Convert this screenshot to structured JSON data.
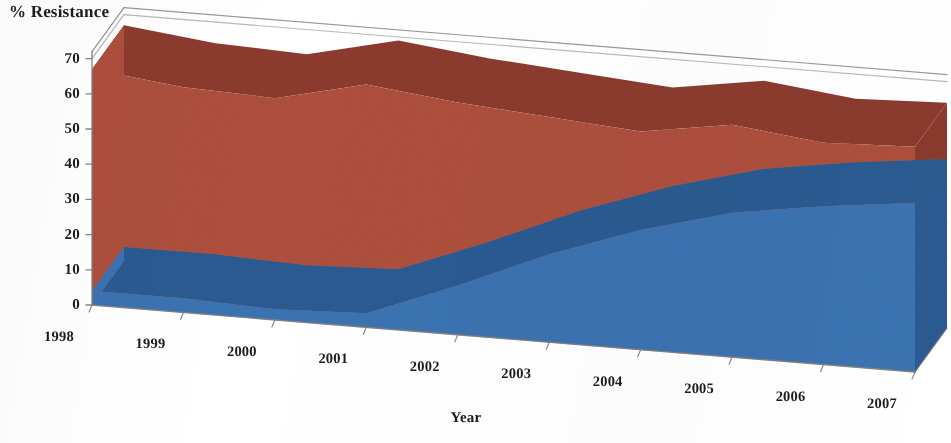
{
  "chart_data": {
    "type": "area",
    "title": "% Resistance",
    "subtitle": "",
    "xlabel": "Year",
    "ylabel": "% Resistance",
    "categories": [
      "1998",
      "1999",
      "2000",
      "2001",
      "2002",
      "2003",
      "2004",
      "2005",
      "2006",
      "2007"
    ],
    "x": [
      1998,
      1999,
      2000,
      2001,
      2002,
      2003,
      2004,
      2005,
      2006,
      2007
    ],
    "series": [
      {
        "name": "series-red-upper",
        "color": "#b0503f",
        "values": [
          67,
          64,
          63,
          69,
          66,
          64,
          62,
          66,
          63,
          64
        ]
      },
      {
        "name": "series-blue-lower",
        "color": "#3b74b4",
        "values": [
          4,
          4,
          3,
          4,
          14,
          25,
          34,
          41,
          45,
          48
        ]
      }
    ],
    "ylim": [
      0,
      70
    ],
    "yticks": [
      0,
      10,
      20,
      30,
      40,
      50,
      60,
      70
    ],
    "ytick_labels": [
      "0",
      "10",
      "20",
      "30",
      "40",
      "50",
      "60",
      "70"
    ],
    "xtick_labels": [
      "1998",
      "1999",
      "2000",
      "2001",
      "2002",
      "2003",
      "2004",
      "2005",
      "2006",
      "2007"
    ],
    "grid": true,
    "legend": "none",
    "projection": "3d"
  },
  "axis": {
    "y_title": "% Resistance",
    "x_title": "Year"
  },
  "colors": {
    "red_face": "#b0503f",
    "red_top": "#8e3b2e",
    "red_side": "#9a4334",
    "blue_face": "#3b74b4",
    "blue_top": "#2c5c93",
    "blue_side": "#2f639d",
    "grid": "#9a9a9a",
    "axis": "#808080",
    "floor": "#fbfbfb",
    "text": "#1c1c1c"
  }
}
